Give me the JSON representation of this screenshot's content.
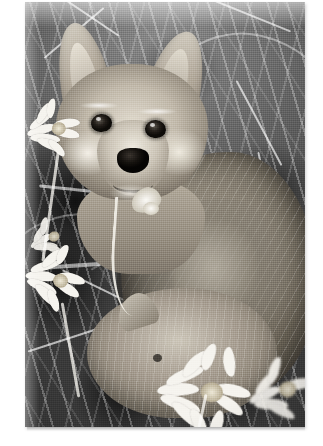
{
  "page": {
    "background_color": "#ffffff",
    "content_type": "photograph",
    "color_mode": "grayscale"
  },
  "photo": {
    "subject": "fox-kit-in-grass",
    "description": "Black and white photograph of a young fox kit sitting upright among tall grass with white daisies; a second fox kit lies in the foreground.",
    "frame": {
      "left": 25,
      "top": 2,
      "width": 280,
      "height": 425,
      "border_color": "#ffffff",
      "shadow_color": "#00000029"
    },
    "palette": {
      "highlight": "#f6f4ee",
      "fur_light": "#d8d2c6",
      "fur_mid": "#9c9384",
      "fur_dark": "#6f6759",
      "background_dark": "#2b2b2b",
      "eye_black": "#0d0b08",
      "nose_black": "#050403"
    },
    "elements": [
      {
        "name": "fox-kit-main",
        "label": "Fox kit facing camera"
      },
      {
        "name": "fox-kit-foreground",
        "label": "Second fox kit in foreground"
      },
      {
        "name": "daisy-upper-left",
        "label": "White daisy, upper left"
      },
      {
        "name": "daisy-mid-left",
        "label": "White daisy, middle left"
      },
      {
        "name": "daisy-lower-left",
        "label": "White daisy, lower left"
      },
      {
        "name": "daisy-bottom-center",
        "label": "Blurred daisy, bottom center"
      },
      {
        "name": "daisy-bottom-right",
        "label": "Blurred daisy, bottom right"
      },
      {
        "name": "flower-bud-stem",
        "label": "Curving flower stem at fox chest"
      },
      {
        "name": "grass-blades",
        "label": "Arcing grass blades filling background"
      }
    ]
  }
}
